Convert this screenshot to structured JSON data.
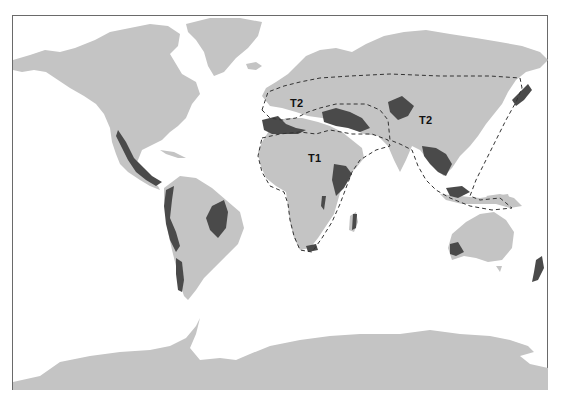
{
  "map": {
    "type": "world-map",
    "projection": "equirectangular-like",
    "colors": {
      "land": "#c4c4c4",
      "highlight_regions": "#4a4a4a",
      "ocean": "#ffffff",
      "boundary_line": "#333333",
      "frame": "#6a6a6a"
    },
    "region_labels": [
      {
        "id": "t2-west",
        "text": "T2"
      },
      {
        "id": "t2-east",
        "text": "T2"
      },
      {
        "id": "t1",
        "text": "T1"
      }
    ],
    "boundaries": [
      {
        "id": "t1-boundary",
        "style": "dashed",
        "encloses": "Africa, Arabia, Mediterranean basin"
      },
      {
        "id": "t2-boundary",
        "style": "dashed",
        "encloses": "Europe-Asia temperate belt, South and East Asia, Maritime Southeast Asia"
      }
    ],
    "highlighted_areas": [
      "Pacific coast of Mexico and Central America",
      "Andean western South America",
      "Eastern Brazil",
      "Southern Chile coast",
      "Iberia and North Africa coast",
      "Anatolia, Caucasus and Iran",
      "Ethiopian highlands",
      "East African rift lakes",
      "Madagascar",
      "Southern tip of Africa",
      "Central Asia",
      "Indochina and Southern China",
      "Borneo and Sumatra",
      "Japan",
      "Southwestern Australia",
      "New Zealand"
    ]
  }
}
